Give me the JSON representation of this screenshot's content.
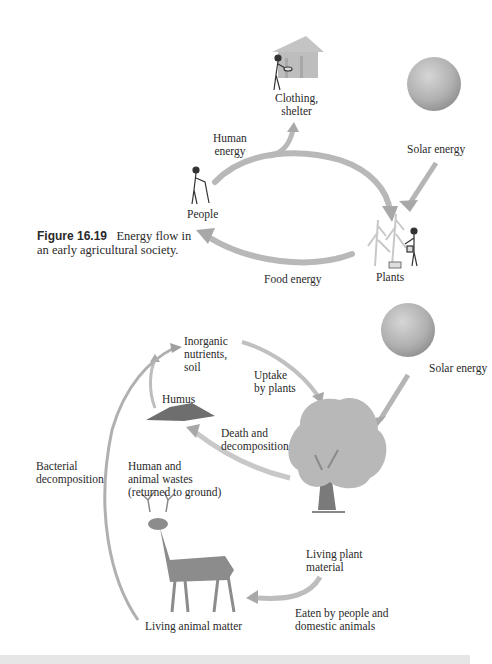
{
  "figure": {
    "number": "Figure 16.19",
    "caption": "Energy flow in an early agricultural society."
  },
  "top_cycle": {
    "nodes": {
      "clothing_shelter": "Clothing,\nshelter",
      "solar_energy": "Solar energy",
      "people": "People",
      "plants": "Plants"
    },
    "arrows": {
      "human_energy": "Human\nenergy",
      "food_energy": "Food energy"
    }
  },
  "bottom_cycle": {
    "nodes": {
      "inorganic_nutrients": "Inorganic\nnutrients,\nsoil",
      "humus": "Humus",
      "solar_energy": "Solar energy",
      "living_plant_material": "Living plant\nmaterial",
      "living_animal_matter": "Living animal matter"
    },
    "arrows": {
      "uptake_by_plants": "Uptake\nby plants",
      "death_and_decomposition": "Death and\ndecomposition",
      "bacterial_decomposition": "Bacterial\ndecomposition",
      "human_animal_wastes": "Human and\nanimal wastes\n(returned to ground)",
      "eaten_by": "Eaten by people and\ndomestic animals"
    }
  },
  "colors": {
    "arrow_light": "#d8d8d8",
    "arrow_dark": "#9a9a9a",
    "sun": "#b5b5b5",
    "tree_foliage": "#b8b8b8",
    "trunk": "#7a7a7a",
    "humus": "#6e6e6e",
    "deer": "#8c8c8c"
  }
}
